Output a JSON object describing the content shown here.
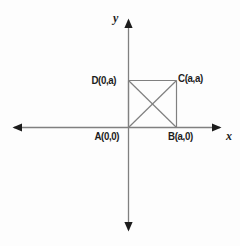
{
  "figure": {
    "background_color": "#fdfdfd",
    "line_color": "#808080",
    "arrow_color": "#1c1c1c",
    "text_color": "#1c1c1c"
  },
  "axes": {
    "x_label": "x",
    "y_label": "y",
    "origin_px": {
      "x": 128,
      "y": 127
    },
    "x_axis_px": {
      "x1": 12,
      "y1": 127,
      "x2": 222,
      "y2": 127
    },
    "y_axis_px": {
      "x1": 128,
      "y1": 18,
      "x2": 128,
      "y2": 232
    },
    "x_arrow_both_ends": true,
    "y_arrow_both_ends": true
  },
  "shape": {
    "name": "square",
    "side_label": "a",
    "diagonals_drawn": true,
    "vertices": [
      {
        "id": "A",
        "label": "A(0,0)",
        "coord_x": "0",
        "coord_y": "0",
        "px": {
          "x": 128,
          "y": 127
        }
      },
      {
        "id": "B",
        "label": "B(a,0)",
        "coord_x": "a",
        "coord_y": "0",
        "px": {
          "x": 176,
          "y": 127
        }
      },
      {
        "id": "C",
        "label": "C(a,a)",
        "coord_x": "a",
        "coord_y": "a",
        "px": {
          "x": 176,
          "y": 80
        }
      },
      {
        "id": "D",
        "label": "D(0,a)",
        "coord_x": "0",
        "coord_y": "a",
        "px": {
          "x": 128,
          "y": 80
        }
      }
    ],
    "edges": [
      {
        "from": "A",
        "to": "B"
      },
      {
        "from": "B",
        "to": "C"
      },
      {
        "from": "C",
        "to": "D"
      },
      {
        "from": "D",
        "to": "A"
      }
    ],
    "diagonals": [
      {
        "from": "A",
        "to": "C"
      },
      {
        "from": "B",
        "to": "D"
      }
    ]
  }
}
